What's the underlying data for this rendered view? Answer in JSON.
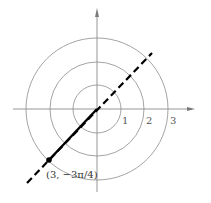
{
  "diagram": {
    "type": "polar-coordinate-plot",
    "center": {
      "x": 97,
      "y": 109
    },
    "unit_px": 24,
    "circles": [
      {
        "r": 1,
        "label": "1"
      },
      {
        "r": 2,
        "label": "2"
      },
      {
        "r": 3,
        "label": "3"
      }
    ],
    "point": {
      "r": 3,
      "theta": "-3π/4",
      "label": "(3, −3π/4)"
    },
    "ray_angle": "π/4",
    "colors": {
      "axis": "#8a8a8a",
      "circle": "#9a9a9a",
      "line": "#000000",
      "label": "#555555"
    }
  }
}
